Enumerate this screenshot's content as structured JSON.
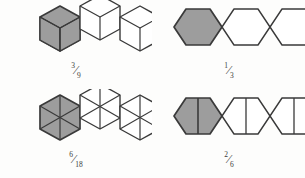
{
  "figure": {
    "background_color": "#fdfdfc",
    "shade_color": "#9d9d9d",
    "unshaded_color": "#ffffff",
    "stroke_color": "#3a3a3a"
  },
  "panels": [
    {
      "id": "top-left",
      "model": "hexagons-as-cubes",
      "hexagon_count": 3,
      "parts_per_hexagon": 3,
      "shaded_parts": 3,
      "total_parts": 9,
      "arrangement": "zigzag",
      "fraction": {
        "numerator": "3",
        "slash": "⁄",
        "denominator": "9",
        "text": "3/9"
      }
    },
    {
      "id": "top-right",
      "model": "plain-hexagons",
      "hexagon_count": 3,
      "parts_per_hexagon": 1,
      "shaded_parts": 1,
      "total_parts": 3,
      "arrangement": "row",
      "fraction": {
        "numerator": "1",
        "slash": "⁄",
        "denominator": "3",
        "text": "1/3"
      }
    },
    {
      "id": "bottom-left",
      "model": "hexagons-in-six-triangles",
      "hexagon_count": 3,
      "parts_per_hexagon": 6,
      "shaded_parts": 6,
      "total_parts": 18,
      "arrangement": "zigzag",
      "fraction": {
        "numerator": "6",
        "slash": "⁄",
        "denominator": "18",
        "text": "6/18"
      }
    },
    {
      "id": "bottom-right",
      "model": "hexagons-split-in-halves",
      "hexagon_count": 3,
      "parts_per_hexagon": 2,
      "shaded_parts": 2,
      "total_parts": 6,
      "arrangement": "row",
      "fraction": {
        "numerator": "2",
        "slash": "⁄",
        "denominator": "6",
        "text": "2/6"
      }
    }
  ]
}
